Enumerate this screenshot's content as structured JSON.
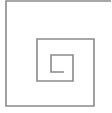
{
  "figure": {
    "type": "square-spiral",
    "width": 112,
    "height": 113,
    "background": "#ffffff",
    "stroke_color": "#8a8a8a",
    "stroke_width": 1.6,
    "path_points": [
      [
        111,
        1
      ],
      [
        6,
        1
      ],
      [
        6,
        106
      ],
      [
        94,
        106
      ],
      [
        94,
        39
      ],
      [
        37,
        39
      ],
      [
        37,
        81
      ],
      [
        73,
        81
      ],
      [
        73,
        55
      ],
      [
        51,
        55
      ],
      [
        51,
        72
      ],
      [
        64,
        72
      ]
    ]
  }
}
